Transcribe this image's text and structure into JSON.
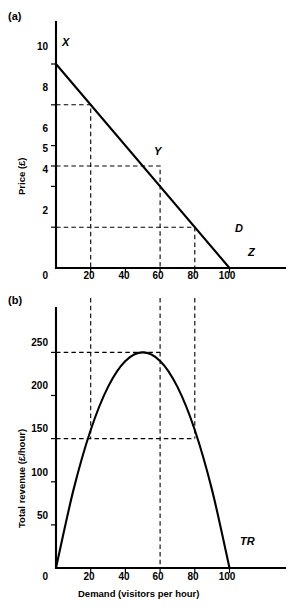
{
  "figure": {
    "panel_a_tag": "(a)",
    "panel_b_tag": "(b)"
  },
  "panel_a": {
    "ylabel": "Price (£)",
    "origin_label": "0",
    "yticks": [
      "2",
      "4",
      "5",
      "6",
      "8",
      "10"
    ],
    "xticks": [
      "20",
      "40",
      "60",
      "80",
      "100"
    ],
    "point_labels": {
      "x_point": "X",
      "y_point": "Y",
      "curve": "D",
      "z_point": "Z"
    }
  },
  "panel_b": {
    "ylabel": "Total revenue (£/hour)",
    "xlabel": "Demand (visitors per hour)",
    "origin_label": "0",
    "yticks": [
      "50",
      "100",
      "150",
      "200",
      "250"
    ],
    "xticks": [
      "20",
      "40",
      "60",
      "80",
      "100"
    ],
    "curve_label": "TR"
  },
  "chart_data": [
    {
      "type": "line",
      "title": "(a)",
      "xlabel": "",
      "ylabel": "Price (£)",
      "xlim": [
        0,
        110
      ],
      "ylim": [
        0,
        11
      ],
      "xticks": [
        0,
        20,
        40,
        60,
        80,
        100
      ],
      "yticks": [
        2,
        4,
        5,
        6,
        8,
        10
      ],
      "grid": false,
      "legend": "none",
      "series": [
        {
          "name": "D",
          "x": [
            0,
            100
          ],
          "values": [
            10,
            0
          ],
          "style": "solid",
          "description": "Linear demand curve from X(0,10) to Z(100,0)"
        }
      ],
      "annotations": [
        {
          "label": "X",
          "x": 0,
          "y": 10
        },
        {
          "label": "Y",
          "x": 50,
          "y": 5
        },
        {
          "label": "D",
          "x": 92,
          "y": 1.1
        },
        {
          "label": "Z",
          "x": 100,
          "y": 0
        }
      ],
      "guide_lines": [
        {
          "price": 8,
          "demand": 20
        },
        {
          "price": 5,
          "demand": 50
        },
        {
          "price": 2,
          "demand": 80
        }
      ]
    },
    {
      "type": "line",
      "title": "(b)",
      "xlabel": "Demand (visitors per hour)",
      "ylabel": "Total revenue (£/hour)",
      "xlim": [
        0,
        110
      ],
      "ylim": [
        0,
        275
      ],
      "xticks": [
        0,
        20,
        40,
        60,
        80,
        100
      ],
      "yticks": [
        50,
        100,
        150,
        200,
        250
      ],
      "grid": false,
      "legend": "none",
      "series": [
        {
          "name": "TR",
          "x": [
            0,
            10,
            20,
            30,
            40,
            50,
            60,
            70,
            80,
            90,
            100
          ],
          "values": [
            0,
            90,
            160,
            210,
            240,
            250,
            240,
            210,
            160,
            90,
            0
          ],
          "style": "solid",
          "description": "Total revenue parabola TR = Q(10 - Q/10), peak 250 at Q=50"
        }
      ],
      "annotations": [
        {
          "label": "TR",
          "x": 96,
          "y": 12
        }
      ],
      "guide_lines": [
        {
          "revenue": 250,
          "demand": 50
        },
        {
          "revenue": 150,
          "demand": 20
        },
        {
          "revenue": 150,
          "demand": 80
        }
      ]
    }
  ]
}
